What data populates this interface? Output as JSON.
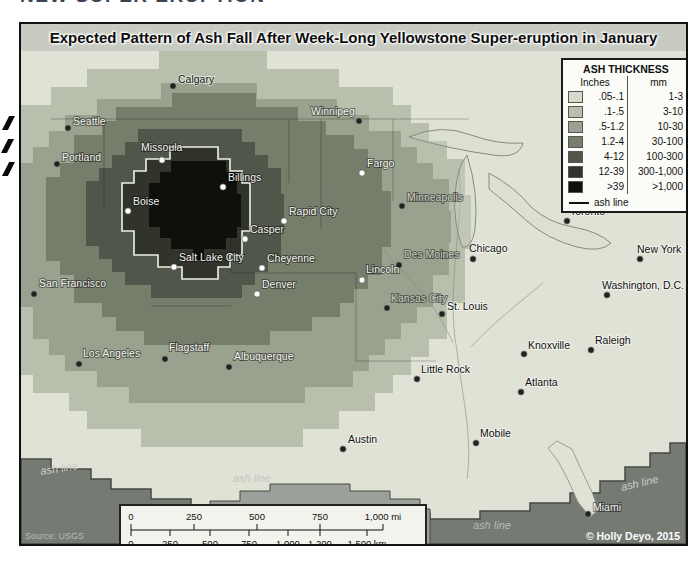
{
  "page": {
    "cropped_heading": "NEW SUPER ERUPTION"
  },
  "map": {
    "title": "Expected Pattern of Ash Fall After Week-Long Yellowstone Super-eruption in January",
    "source": "Source: USGS",
    "copyright": "© Holly Deyo, 2015",
    "legend": {
      "title": "ASH THICKNESS",
      "col_inches": "Inches",
      "col_mm": "mm",
      "ash_line_label": "ash line",
      "rows": [
        {
          "inches": ".05-.1",
          "mm": "1-3",
          "color": "#d6dac9"
        },
        {
          "inches": ".1-.5",
          "mm": "3-10",
          "color": "#b8bfad"
        },
        {
          "inches": ".5-1.2",
          "mm": "10-30",
          "color": "#99a28e"
        },
        {
          "inches": "1.2-4",
          "mm": "30-100",
          "color": "#757d6b"
        },
        {
          "inches": "4-12",
          "mm": "100-300",
          "color": "#50564a"
        },
        {
          "inches": "12-39",
          "mm": "300-1,000",
          "color": "#30342b"
        },
        {
          "inches": ">39",
          "mm": ">1,000",
          "color": "#0e100c"
        }
      ]
    },
    "scalebar": {
      "miles_ticks": [
        "0",
        "250",
        "500",
        "750",
        "1,000 mi"
      ],
      "km_ticks": [
        "0",
        "250",
        "500",
        "750",
        "1,000",
        "1,200",
        "1,500 km"
      ]
    },
    "zones": [
      {
        "label": ".05-.1",
        "color": "#dfe2d4",
        "base": true
      },
      {
        "label": ".1-.5",
        "color": "#b8bfad",
        "cx": 200,
        "cy": 170,
        "L": 260,
        "R": 250,
        "T": 165,
        "B": 230,
        "g": 18
      },
      {
        "label": ".5-1.2",
        "color": "#99a28e",
        "cx": 190,
        "cy": 175,
        "L": 210,
        "R": 240,
        "T": 138,
        "B": 185,
        "g": 16
      },
      {
        "label": "1.2-4",
        "color": "#757d6b",
        "cx": 185,
        "cy": 165,
        "L": 160,
        "R": 185,
        "T": 120,
        "B": 130,
        "g": 14
      },
      {
        "label": "4-12",
        "color": "#50564a",
        "cx": 183,
        "cy": 160,
        "L": 118,
        "R": 80,
        "T": 88,
        "B": 92,
        "g": 13
      },
      {
        "label": "12-39",
        "color": "#30342b",
        "cx": 181,
        "cy": 158,
        "L": 80,
        "R": 48,
        "T": 62,
        "B": 66,
        "g": 12,
        "ashline": true
      },
      {
        "label": ">39",
        "color": "#0e100c",
        "cx": 178,
        "cy": 156,
        "L": 50,
        "R": 42,
        "T": 50,
        "B": 48,
        "g": 11
      }
    ],
    "outside": {
      "band_color": "#757a73",
      "band_edge_color": "#454a43",
      "band": "0,408 30,408 30,418 70,418 70,428 90,428 90,438 130,438 130,448 170,448 170,456 189,456 189,462 409,462 409,468 459,468 459,460 509,460 509,452 549,452 549,442 579,442 579,430 604,430 604,416 629,416 629,402 649,402 649,392 665,392 665,493 0,493",
      "protrusion_color": "#9ba09a",
      "protrusion": "189,493 189,450 219,450 219,440 249,440 249,433 329,433 329,440 369,440 369,448 399,448 399,458 409,458 409,493",
      "florida": "M536,390 L551,398 559,416 571,441 577,459 569,466 557,451 547,429 537,410 527,397 Z"
    },
    "geo": {
      "borders": [
        [
          30,
          68,
          448,
          68
        ],
        [
          83,
          68,
          83,
          160
        ],
        [
          300,
          68,
          300,
          178
        ],
        [
          210,
          150,
          210,
          222
        ],
        [
          210,
          222,
          335,
          222
        ],
        [
          335,
          222,
          335,
          310
        ],
        [
          130,
          255,
          210,
          255
        ],
        [
          268,
          68,
          268,
          132
        ],
        [
          372,
          68,
          372,
          150
        ],
        [
          335,
          310,
          415,
          310
        ]
      ],
      "rivers": [
        "M438,118 C444,170 424,235 436,300 C441,345 452,385 446,428",
        "M302,132 C342,172 362,200 378,216 C392,232 414,252 432,292",
        "M522,232 C498,252 472,272 450,296"
      ],
      "lakes": [
        "M388,86 q32,-14 62,-2 q28,10 52,8 q-4,16 -30,12 q-44,-6 -84,-18 z",
        "M446,104 q12,38 8,74 q-3,20 -13,18 q-9,-26 -7,-52 q2,-28 12,-40 z",
        "M468,122 q26,14 42,34 q18,16 42,20 q24,4 38,16 q-10,10 -34,4 q-30,-8 -50,-26 q-20,-18 -38,-32 z"
      ]
    },
    "ash_line_text": "ash line",
    "ash_line_labels": [
      {
        "x": 20,
        "y": 424,
        "r": -9,
        "c": "#c9cdc5"
      },
      {
        "x": 212,
        "y": 431,
        "r": 0,
        "c": "#c2c7bf"
      },
      {
        "x": 452,
        "y": 478,
        "r": 0,
        "c": "#b5bab2"
      },
      {
        "x": 601,
        "y": 440,
        "r": -13,
        "c": "#c9cdc5"
      }
    ],
    "cities": [
      {
        "n": "Calgary",
        "x": 152,
        "y": 35,
        "lx": 157,
        "ly": 32,
        "t": "b",
        "d": "dark"
      },
      {
        "n": "Seattle",
        "x": 47,
        "y": 77,
        "lx": 52,
        "ly": 74,
        "t": "w",
        "d": "dark"
      },
      {
        "n": "Portland",
        "x": 36,
        "y": 113,
        "lx": 41,
        "ly": 110,
        "t": "w",
        "d": "dark"
      },
      {
        "n": "Missoula",
        "x": 141,
        "y": 109,
        "lx": 120,
        "ly": 100,
        "t": "w",
        "d": "white"
      },
      {
        "n": "Billings",
        "x": 202,
        "y": 136,
        "lx": 207,
        "ly": 130,
        "t": "w",
        "d": "white"
      },
      {
        "n": "Boise",
        "x": 107,
        "y": 160,
        "lx": 112,
        "ly": 154,
        "t": "w",
        "d": "white"
      },
      {
        "n": "Rapid City",
        "x": 263,
        "y": 170,
        "lx": 268,
        "ly": 164,
        "t": "w",
        "d": "white"
      },
      {
        "n": "Casper",
        "x": 224,
        "y": 188,
        "lx": 229,
        "ly": 182,
        "t": "w",
        "d": "white"
      },
      {
        "n": "Salt Lake City",
        "x": 153,
        "y": 216,
        "lx": 158,
        "ly": 210,
        "t": "w",
        "d": "white"
      },
      {
        "n": "Cheyenne",
        "x": 241,
        "y": 217,
        "lx": 246,
        "ly": 211,
        "t": "w",
        "d": "white"
      },
      {
        "n": "Denver",
        "x": 236,
        "y": 243,
        "lx": 241,
        "ly": 237,
        "t": "w",
        "d": "white"
      },
      {
        "n": "Winnipeg",
        "x": 338,
        "y": 70,
        "lx": 290,
        "ly": 64,
        "t": "w",
        "d": "dark"
      },
      {
        "n": "Fargo",
        "x": 341,
        "y": 122,
        "lx": 346,
        "ly": 116,
        "t": "w",
        "d": "white"
      },
      {
        "n": "Minneapolis",
        "x": 381,
        "y": 155,
        "lx": 386,
        "ly": 150,
        "t": "g",
        "d": "dark"
      },
      {
        "n": "Des Moines",
        "x": 378,
        "y": 214,
        "lx": 383,
        "ly": 207,
        "t": "g",
        "d": "dark"
      },
      {
        "n": "Lincoln",
        "x": 341,
        "y": 229,
        "lx": 345,
        "ly": 222,
        "t": "w",
        "d": "white"
      },
      {
        "n": "Chicago",
        "x": 452,
        "y": 208,
        "lx": 448,
        "ly": 201,
        "t": "b",
        "d": "dark"
      },
      {
        "n": "Toronto",
        "x": 546,
        "y": 170,
        "lx": 549,
        "ly": 164,
        "t": "b",
        "d": "dark"
      },
      {
        "n": "New York",
        "x": 619,
        "y": 208,
        "lx": 616,
        "ly": 202,
        "t": "b",
        "d": "dark"
      },
      {
        "n": "Washington, D.C.",
        "x": 586,
        "y": 244,
        "lx": 581,
        "ly": 238,
        "t": "b",
        "d": "dark"
      },
      {
        "n": "San Francisco",
        "x": 13,
        "y": 243,
        "lx": 18,
        "ly": 236,
        "t": "w",
        "d": "dark"
      },
      {
        "n": "Los Angeles",
        "x": 58,
        "y": 313,
        "lx": 62,
        "ly": 306,
        "t": "w",
        "d": "dark"
      },
      {
        "n": "Flagstaff",
        "x": 144,
        "y": 308,
        "lx": 148,
        "ly": 300,
        "t": "w",
        "d": "dark"
      },
      {
        "n": "Albuquerque",
        "x": 208,
        "y": 316,
        "lx": 213,
        "ly": 309,
        "t": "w",
        "d": "dark"
      },
      {
        "n": "Kansas City",
        "x": 366,
        "y": 257,
        "lx": 370,
        "ly": 251,
        "t": "g",
        "d": "dark"
      },
      {
        "n": "St. Louis",
        "x": 421,
        "y": 263,
        "lx": 426,
        "ly": 259,
        "t": "b",
        "d": "dark"
      },
      {
        "n": "Little Rock",
        "x": 396,
        "y": 328,
        "lx": 400,
        "ly": 322,
        "t": "b",
        "d": "dark"
      },
      {
        "n": "Knoxville",
        "x": 503,
        "y": 303,
        "lx": 507,
        "ly": 298,
        "t": "b",
        "d": "dark"
      },
      {
        "n": "Raleigh",
        "x": 570,
        "y": 299,
        "lx": 574,
        "ly": 293,
        "t": "b",
        "d": "dark"
      },
      {
        "n": "Atlanta",
        "x": 500,
        "y": 341,
        "lx": 504,
        "ly": 335,
        "t": "b",
        "d": "dark"
      },
      {
        "n": "Mobile",
        "x": 455,
        "y": 392,
        "lx": 459,
        "ly": 386,
        "t": "b",
        "d": "dark"
      },
      {
        "n": "Austin",
        "x": 322,
        "y": 398,
        "lx": 327,
        "ly": 392,
        "t": "b",
        "d": "dark"
      },
      {
        "n": "Miami",
        "x": 567,
        "y": 463,
        "lx": 572,
        "ly": 460,
        "t": "w",
        "d": "dark"
      }
    ]
  }
}
